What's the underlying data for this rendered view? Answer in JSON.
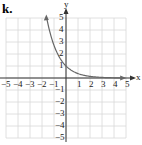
{
  "panel_label": "k.",
  "chart_data": {
    "type": "line",
    "title": "",
    "xlabel": "x",
    "ylabel": "y",
    "xlim": [
      -5,
      5
    ],
    "ylim": [
      -5,
      5
    ],
    "grid": true,
    "x_ticks": [
      -5,
      -4,
      -3,
      -2,
      -1,
      1,
      2,
      3,
      4,
      5
    ],
    "y_ticks": [
      5,
      4,
      3,
      2,
      1,
      -1,
      -2,
      -3,
      -4,
      -5
    ],
    "x_tick_labels": [
      "−5",
      "−4",
      "−3",
      "−2",
      "−1",
      "1",
      "2",
      "3",
      "4",
      "5"
    ],
    "y_tick_labels": [
      "5",
      "4",
      "3",
      "2",
      "1",
      "−1",
      "−2",
      "−3",
      "−4",
      "−5"
    ],
    "series": [
      {
        "name": "y = e^(-x)",
        "x": [
          -1.6,
          -1.2,
          -0.8,
          -0.4,
          0,
          0.5,
          1,
          1.5,
          2,
          2.5,
          3,
          3.5,
          4,
          4.5
        ],
        "y": [
          4.95,
          3.32,
          2.23,
          1.49,
          1,
          0.61,
          0.37,
          0.22,
          0.14,
          0.08,
          0.05,
          0.03,
          0.02,
          0.01
        ],
        "arrows": "both",
        "color": "#666666"
      }
    ],
    "asymptote": "y = 0"
  },
  "colors": {
    "grid": "#d8d8d8",
    "axis": "#333333",
    "curve": "#666666"
  }
}
